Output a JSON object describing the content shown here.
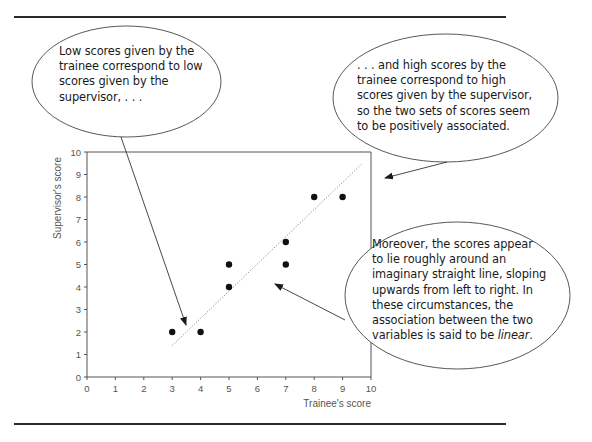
{
  "figure": {
    "callouts": {
      "low": {
        "lines": [
          "Low scores given by the",
          "trainee correspond to low",
          "scores given by the",
          "supervisor, . . ."
        ]
      },
      "high": {
        "lines": [
          ". . . and high scores by the",
          "trainee correspond to high",
          "scores given by the supervisor,",
          "so the two sets of scores seem",
          "to be positively associated."
        ]
      },
      "linear": {
        "lines": [
          "Moreover, the scores appear",
          "to lie roughly around an",
          "imaginary straight line, sloping",
          "upwards from left to right. In",
          "these circumstances, the",
          "association between the two"
        ],
        "last_line_prefix": "variables is said to be ",
        "last_line_emphasis": "linear",
        "last_line_suffix": "."
      }
    },
    "colors": {
      "ink": "#1a1a1a",
      "axis": "#555555",
      "rule": "#2a2a2a",
      "trend": "#999999"
    }
  },
  "chart_data": {
    "type": "scatter",
    "title": "",
    "xlabel": "Trainee's score",
    "ylabel": "Supervisor's score",
    "xlim": [
      0,
      10
    ],
    "ylim": [
      0,
      10
    ],
    "xticks": [
      "0",
      "1",
      "2",
      "3",
      "4",
      "5",
      "6",
      "7",
      "8",
      "9",
      "10"
    ],
    "yticks": [
      "0",
      "1",
      "2",
      "3",
      "4",
      "5",
      "6",
      "7",
      "8",
      "9",
      "10"
    ],
    "grid": false,
    "legend": null,
    "points": [
      {
        "x": 3,
        "y": 2
      },
      {
        "x": 4,
        "y": 2
      },
      {
        "x": 5,
        "y": 4
      },
      {
        "x": 5,
        "y": 5
      },
      {
        "x": 7,
        "y": 5
      },
      {
        "x": 7,
        "y": 6
      },
      {
        "x": 8,
        "y": 8
      },
      {
        "x": 9,
        "y": 8
      }
    ],
    "trend_line": {
      "style": "dotted",
      "from": {
        "x": 3,
        "y": 1.4
      },
      "to": {
        "x": 9.7,
        "y": 9.5
      }
    }
  }
}
